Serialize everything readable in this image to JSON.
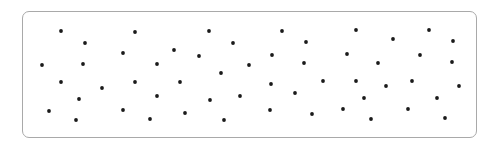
{
  "canvas": {
    "width": 494,
    "height": 147,
    "background": "#ffffff"
  },
  "frame": {
    "x": 22,
    "y": 11,
    "width": 455,
    "height": 127,
    "radius": 7,
    "border_color": "#a9a9a9"
  },
  "dot_style": {
    "radius": 1.9,
    "color": "#1a1a1a"
  },
  "dot_count": 51,
  "dots": [
    [
      61,
      31
    ],
    [
      85,
      43
    ],
    [
      42,
      65
    ],
    [
      83,
      64
    ],
    [
      61,
      82
    ],
    [
      79,
      99
    ],
    [
      49,
      111
    ],
    [
      76,
      120
    ],
    [
      135,
      32
    ],
    [
      123,
      53
    ],
    [
      157,
      64
    ],
    [
      135,
      82
    ],
    [
      102,
      88
    ],
    [
      157,
      96
    ],
    [
      123,
      110
    ],
    [
      150,
      119
    ],
    [
      209,
      31
    ],
    [
      233,
      43
    ],
    [
      174,
      50
    ],
    [
      199,
      56
    ],
    [
      221,
      73
    ],
    [
      180,
      82
    ],
    [
      210,
      100
    ],
    [
      185,
      113
    ],
    [
      224,
      120
    ],
    [
      282,
      31
    ],
    [
      306,
      42
    ],
    [
      272,
      55
    ],
    [
      249,
      65
    ],
    [
      304,
      63
    ],
    [
      271,
      84
    ],
    [
      240,
      96
    ],
    [
      295,
      93
    ],
    [
      270,
      110
    ],
    [
      312,
      114
    ],
    [
      356,
      30
    ],
    [
      347,
      54
    ],
    [
      378,
      63
    ],
    [
      323,
      81
    ],
    [
      356,
      81
    ],
    [
      364,
      98
    ],
    [
      343,
      109
    ],
    [
      371,
      119
    ],
    [
      393,
      39
    ],
    [
      429,
      30
    ],
    [
      453,
      41
    ],
    [
      420,
      55
    ],
    [
      452,
      62
    ],
    [
      386,
      86
    ],
    [
      412,
      81
    ],
    [
      459,
      86
    ],
    [
      437,
      98
    ],
    [
      408,
      109
    ],
    [
      445,
      118
    ]
  ]
}
